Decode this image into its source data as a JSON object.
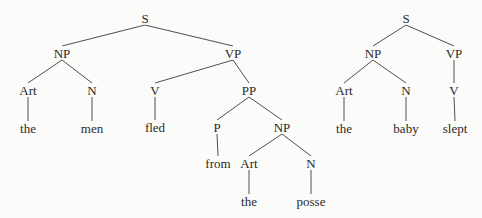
{
  "trees": [
    {
      "sentence": "the men fled from the posse",
      "nodes": [
        {
          "id": "s",
          "label": "S",
          "x": 145,
          "y": 18
        },
        {
          "id": "np1",
          "label": "NP",
          "x": 62,
          "y": 53
        },
        {
          "id": "vp1",
          "label": "VP",
          "x": 233,
          "y": 53
        },
        {
          "id": "art1",
          "label": "Art",
          "x": 28,
          "y": 90
        },
        {
          "id": "n1",
          "label": "N",
          "x": 92,
          "y": 90
        },
        {
          "id": "v1",
          "label": "V",
          "x": 155,
          "y": 90
        },
        {
          "id": "pp1",
          "label": "PP",
          "x": 249,
          "y": 90
        },
        {
          "id": "w_the1",
          "label": "the",
          "x": 28,
          "y": 128
        },
        {
          "id": "w_men",
          "label": "men",
          "x": 92,
          "y": 128
        },
        {
          "id": "w_fled",
          "label": "fled",
          "x": 155,
          "y": 127
        },
        {
          "id": "p1",
          "label": "P",
          "x": 217,
          "y": 127
        },
        {
          "id": "np2",
          "label": "NP",
          "x": 282,
          "y": 127
        },
        {
          "id": "w_from",
          "label": "from",
          "x": 218,
          "y": 163
        },
        {
          "id": "art2",
          "label": "Art",
          "x": 249,
          "y": 163
        },
        {
          "id": "n2",
          "label": "N",
          "x": 311,
          "y": 163
        },
        {
          "id": "w_the2",
          "label": "the",
          "x": 249,
          "y": 201
        },
        {
          "id": "w_posse",
          "label": "posse",
          "x": 311,
          "y": 201
        }
      ],
      "edges": [
        [
          "s",
          "np1"
        ],
        [
          "s",
          "vp1"
        ],
        [
          "np1",
          "art1"
        ],
        [
          "np1",
          "n1"
        ],
        [
          "vp1",
          "v1"
        ],
        [
          "vp1",
          "pp1"
        ],
        [
          "art1",
          "w_the1"
        ],
        [
          "n1",
          "w_men"
        ],
        [
          "v1",
          "w_fled"
        ],
        [
          "pp1",
          "p1"
        ],
        [
          "pp1",
          "np2"
        ],
        [
          "p1",
          "w_from"
        ],
        [
          "np2",
          "art2"
        ],
        [
          "np2",
          "n2"
        ],
        [
          "art2",
          "w_the2"
        ],
        [
          "n2",
          "w_posse"
        ]
      ]
    },
    {
      "sentence": "the baby slept",
      "nodes": [
        {
          "id": "s",
          "label": "S",
          "x": 406,
          "y": 18
        },
        {
          "id": "np",
          "label": "NP",
          "x": 373,
          "y": 53
        },
        {
          "id": "vp",
          "label": "VP",
          "x": 454,
          "y": 53
        },
        {
          "id": "art",
          "label": "Art",
          "x": 344,
          "y": 90
        },
        {
          "id": "n",
          "label": "N",
          "x": 406,
          "y": 90
        },
        {
          "id": "v",
          "label": "V",
          "x": 454,
          "y": 90
        },
        {
          "id": "w_the",
          "label": "the",
          "x": 344,
          "y": 128
        },
        {
          "id": "w_baby",
          "label": "baby",
          "x": 406,
          "y": 128
        },
        {
          "id": "w_slept",
          "label": "slept",
          "x": 455,
          "y": 128
        }
      ],
      "edges": [
        [
          "s",
          "np"
        ],
        [
          "s",
          "vp"
        ],
        [
          "np",
          "art"
        ],
        [
          "np",
          "n"
        ],
        [
          "vp",
          "v"
        ],
        [
          "art",
          "w_the"
        ],
        [
          "n",
          "w_baby"
        ],
        [
          "v",
          "w_slept"
        ]
      ]
    }
  ],
  "colors": {
    "ink": "#2a2a2a",
    "line": "#3a3a3a",
    "background": "#fbfbf9"
  }
}
